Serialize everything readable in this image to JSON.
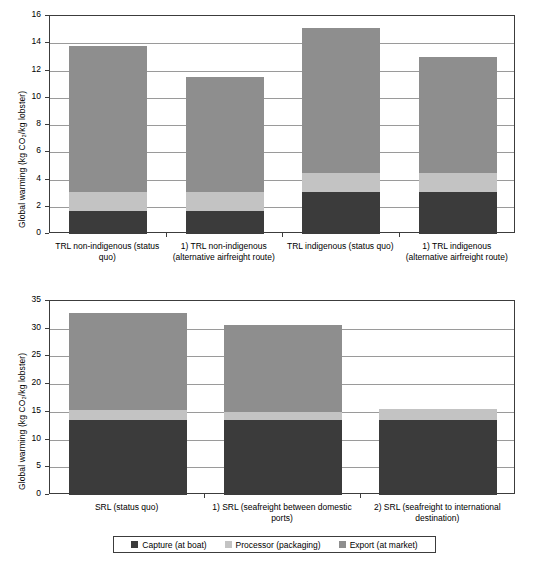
{
  "legend": {
    "items": [
      {
        "label": "Capture (at boat)",
        "color": "#3b3b3b",
        "key": "capture"
      },
      {
        "label": "Processor (packaging)",
        "color": "#c3c3c3",
        "key": "processor"
      },
      {
        "label": "Export (at market)",
        "color": "#8e8e8e",
        "key": "export"
      }
    ]
  },
  "chart_data": [
    {
      "id": "top",
      "type": "bar",
      "stacked": true,
      "title": "",
      "xlabel": "",
      "ylabel": "Global warming (kg CO2/kg lobster)",
      "ylabel_display": "Global warming (kg CO₂/kg lobster)",
      "ylim": [
        0,
        16
      ],
      "yticks": [
        0,
        2,
        4,
        6,
        8,
        10,
        12,
        14,
        16
      ],
      "ytick_labels": [
        "0",
        "2",
        "4",
        "6",
        "8",
        "10",
        "12",
        "14",
        "16"
      ],
      "grid": true,
      "legend_position": "bottom-shared",
      "categories": [
        "TRL non-indigenous (status quo)",
        "1) TRL non-indigenous (alternative airfreight route)",
        "TRL indigenous (status quo)",
        "1) TRL indigenous (alternative airfreight route)"
      ],
      "series": [
        {
          "name": "Capture (at boat)",
          "color": "#3b3b3b",
          "values": [
            1.7,
            1.7,
            3.1,
            3.1
          ]
        },
        {
          "name": "Processor (packaging)",
          "color": "#c3c3c3",
          "values": [
            1.4,
            1.4,
            1.4,
            1.4
          ]
        },
        {
          "name": "Export (at market)",
          "color": "#8e8e8e",
          "values": [
            10.7,
            8.4,
            10.6,
            8.5
          ]
        }
      ],
      "totals": [
        13.8,
        11.5,
        15.1,
        13.0
      ]
    },
    {
      "id": "bottom",
      "type": "bar",
      "stacked": true,
      "title": "",
      "xlabel": "",
      "ylabel": "Global warming (kg CO2/kg lobster)",
      "ylabel_display": "Global warming (kg CO₂/kg lobster)",
      "ylim": [
        0,
        35
      ],
      "yticks": [
        0,
        5,
        10,
        15,
        20,
        25,
        30,
        35
      ],
      "ytick_labels": [
        "0",
        "5",
        "10",
        "15",
        "20",
        "25",
        "30",
        "35"
      ],
      "grid": true,
      "legend_position": "bottom-shared",
      "categories": [
        "SRL (status quo)",
        "1) SRL (seafreight between domestic ports)",
        "2) SRL (seafreight to international destination)"
      ],
      "series": [
        {
          "name": "Capture (at boat)",
          "color": "#3b3b3b",
          "values": [
            13.6,
            13.5,
            13.6
          ]
        },
        {
          "name": "Processor (packaging)",
          "color": "#c3c3c3",
          "values": [
            1.8,
            1.4,
            2.0
          ]
        },
        {
          "name": "Export (at market)",
          "color": "#8e8e8e",
          "values": [
            17.4,
            15.7,
            0.0
          ]
        }
      ],
      "totals": [
        32.8,
        30.6,
        15.6
      ]
    }
  ]
}
